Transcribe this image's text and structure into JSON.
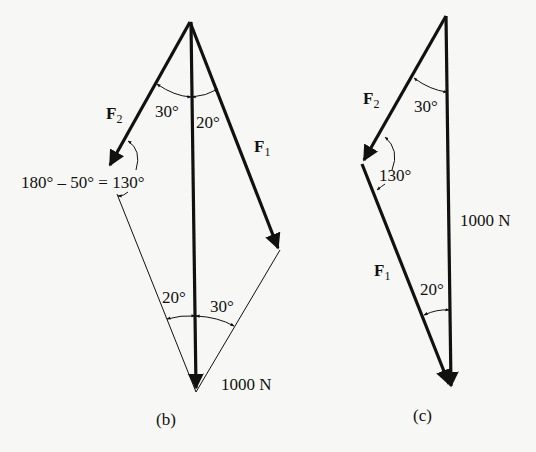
{
  "figure_b": {
    "caption": "(b)",
    "vectors": {
      "F2": {
        "symbol": "F",
        "sub": "2"
      },
      "F1": {
        "symbol": "F",
        "sub": "1"
      },
      "resultant": {
        "label": "1000 N"
      }
    },
    "angles": {
      "top_left": "30°",
      "top_right": "20°",
      "bottom_left": "20°",
      "bottom_right": "30°",
      "equation": "180° – 50° = 130°"
    }
  },
  "figure_c": {
    "caption": "(c)",
    "vectors": {
      "F2": {
        "symbol": "F",
        "sub": "2"
      },
      "F1": {
        "symbol": "F",
        "sub": "1"
      },
      "resultant": {
        "label": "1000 N"
      }
    },
    "angles": {
      "top": "30°",
      "middle": "130°",
      "bottom": "20°"
    }
  },
  "colors": {
    "ink": "#111111",
    "paper": "#f7f7f5"
  }
}
